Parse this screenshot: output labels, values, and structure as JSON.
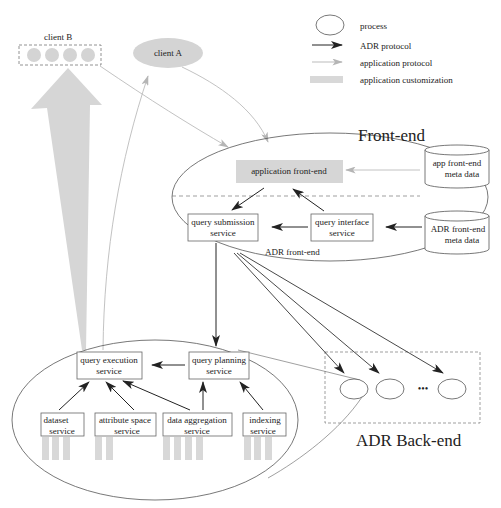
{
  "legend": {
    "process": "process",
    "adr_protocol": "ADR protocol",
    "application_protocol": "application protocol",
    "application_customization": "application customization"
  },
  "clients": {
    "client_b": "client B",
    "client_a": "client A"
  },
  "frontend": {
    "title": "Front-end",
    "application_frontend": "application front-end",
    "query_submission": [
      "query submission",
      "service"
    ],
    "query_interface": [
      "query interface",
      "service"
    ],
    "adr_frontend_label": "ADR front-end",
    "app_meta": [
      "app front-end",
      "meta data"
    ],
    "adr_meta": [
      "ADR front-end",
      "meta data"
    ]
  },
  "backend_process": {
    "query_execution": [
      "query execution",
      "service"
    ],
    "query_planning": [
      "query planning",
      "service"
    ],
    "dataset": [
      "dataset",
      "service"
    ],
    "attribute_space": [
      "attribute space",
      "service"
    ],
    "data_aggregation": [
      "data aggregation",
      "service"
    ],
    "indexing": [
      "indexing",
      "service"
    ]
  },
  "backend": {
    "title": "ADR Back-end",
    "ellipsis": "•••"
  },
  "colors": {
    "adr_arrow": "#333333",
    "app_arrow": "#b8b8b8",
    "customization": "#d6d6d6",
    "line": "#555555"
  }
}
